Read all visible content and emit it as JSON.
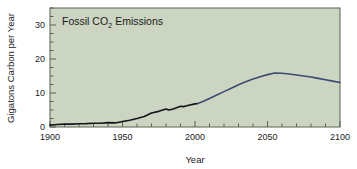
{
  "chart_data": {
    "type": "line",
    "title": "Fossil CO2 Emissions",
    "title_parts": {
      "before": "Fossil CO",
      "subscript": "2",
      "after": " Emissions"
    },
    "xlabel": "Year",
    "ylabel": "Gigatons Carbon per Year",
    "xlim": [
      1900,
      2100
    ],
    "ylim": [
      0,
      35
    ],
    "xticks": [
      1900,
      1950,
      2000,
      2050,
      2100
    ],
    "xtick_labels": [
      "1900",
      "1950",
      "2000",
      "2050",
      "2100"
    ],
    "x_minor_tick_interval": 10,
    "yticks": [
      0,
      10,
      20,
      30
    ],
    "ytick_labels": [
      "0",
      "10",
      "20",
      "30"
    ],
    "y_minor_tick_interval": 2.5,
    "grid": false,
    "legend": "none",
    "plot_background_color": "#ccd5c2",
    "axis_color": "#5a6352",
    "series": [
      {
        "name": "Historical fossil CO2 emissions",
        "color": "#14161a",
        "linewidth": 1.6,
        "x": [
          1900,
          1905,
          1910,
          1915,
          1920,
          1925,
          1930,
          1935,
          1940,
          1945,
          1950,
          1955,
          1960,
          1965,
          1970,
          1975,
          1980,
          1982,
          1985,
          1990,
          1992,
          1995,
          2000,
          2002
        ],
        "values": [
          0.55,
          0.75,
          0.85,
          0.85,
          0.95,
          1.0,
          1.1,
          1.1,
          1.3,
          1.2,
          1.6,
          2.0,
          2.5,
          3.1,
          4.1,
          4.6,
          5.3,
          5.0,
          5.3,
          6.1,
          6.0,
          6.3,
          6.8,
          6.9
        ]
      },
      {
        "name": "Projected fossil CO2 emissions",
        "color": "#3d4a74",
        "linewidth": 1.6,
        "x": [
          2002,
          2005,
          2010,
          2015,
          2020,
          2025,
          2030,
          2035,
          2040,
          2045,
          2050,
          2055,
          2060,
          2065,
          2070,
          2075,
          2080,
          2085,
          2090,
          2095,
          2100
        ],
        "values": [
          6.9,
          7.4,
          8.4,
          9.4,
          10.4,
          11.4,
          12.4,
          13.3,
          14.1,
          14.8,
          15.4,
          15.9,
          15.8,
          15.6,
          15.3,
          15.0,
          14.7,
          14.3,
          13.9,
          13.5,
          13.1
        ]
      }
    ]
  }
}
